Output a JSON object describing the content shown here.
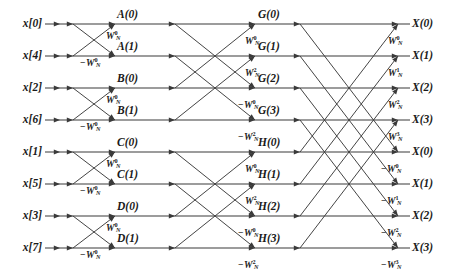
{
  "diagram": {
    "width": 451,
    "height": 278,
    "line_color": "#3a3a3a",
    "text_color": "#1a1a1a",
    "background": "#ffffff"
  },
  "inputs": [
    {
      "label": "x[0]",
      "row": 0
    },
    {
      "label": "x[4]",
      "row": 1
    },
    {
      "label": "x[2]",
      "row": 2
    },
    {
      "label": "x[6]",
      "row": 3
    },
    {
      "label": "x[1]",
      "row": 4
    },
    {
      "label": "x[5]",
      "row": 5
    },
    {
      "label": "x[3]",
      "row": 6
    },
    {
      "label": "x[7]",
      "row": 7
    }
  ],
  "stage1_labels": [
    {
      "label": "A(0)",
      "row": 0
    },
    {
      "label": "A(1)",
      "row": 1
    },
    {
      "label": "B(0)",
      "row": 2
    },
    {
      "label": "B(1)",
      "row": 3
    },
    {
      "label": "C(0)",
      "row": 4
    },
    {
      "label": "C(1)",
      "row": 5
    },
    {
      "label": "D(0)",
      "row": 6
    },
    {
      "label": "D(1)",
      "row": 7
    }
  ],
  "stage2_labels": [
    {
      "label": "G(0)",
      "row": 0
    },
    {
      "label": "G(1)",
      "row": 1
    },
    {
      "label": "G(2)",
      "row": 2
    },
    {
      "label": "G(3)",
      "row": 3
    },
    {
      "label": "H(0)",
      "row": 4
    },
    {
      "label": "H(1)",
      "row": 5
    },
    {
      "label": "H(2)",
      "row": 6
    },
    {
      "label": "H(3)",
      "row": 7
    }
  ],
  "outputs": [
    {
      "label": "X(0)",
      "row": 0
    },
    {
      "label": "X(1)",
      "row": 1
    },
    {
      "label": "X(2)",
      "row": 2
    },
    {
      "label": "X(3)",
      "row": 3
    },
    {
      "label": "X(0)",
      "row": 4
    },
    {
      "label": "X(1)",
      "row": 5
    },
    {
      "label": "X(2)",
      "row": 6
    },
    {
      "label": "X(3)",
      "row": 7
    }
  ],
  "twiddles": {
    "stage1": [
      {
        "sign": "",
        "base": "W",
        "sup": "0",
        "sub": "N",
        "x": 106,
        "y": 32
      },
      {
        "sign": "−",
        "base": "W",
        "sup": "0",
        "sub": "N",
        "x": 80,
        "y": 59
      },
      {
        "sign": "",
        "base": "W",
        "sup": "0",
        "sub": "N",
        "x": 106,
        "y": 96
      },
      {
        "sign": "−",
        "base": "W",
        "sup": "0",
        "sub": "N",
        "x": 80,
        "y": 123
      },
      {
        "sign": "",
        "base": "W",
        "sup": "0",
        "sub": "N",
        "x": 106,
        "y": 160
      },
      {
        "sign": "−",
        "base": "W",
        "sup": "0",
        "sub": "N",
        "x": 80,
        "y": 187
      },
      {
        "sign": "",
        "base": "W",
        "sup": "0",
        "sub": "N",
        "x": 106,
        "y": 224
      },
      {
        "sign": "−",
        "base": "W",
        "sup": "0",
        "sub": "N",
        "x": 80,
        "y": 251
      }
    ],
    "stage2": [
      {
        "sign": "",
        "base": "W",
        "sup": "0",
        "sub": "N",
        "x": 245,
        "y": 37
      },
      {
        "sign": "",
        "base": "W",
        "sup": "2",
        "sub": "N",
        "x": 245,
        "y": 69
      },
      {
        "sign": "−",
        "base": "W",
        "sup": "0",
        "sub": "N",
        "x": 238,
        "y": 101
      },
      {
        "sign": "−",
        "base": "W",
        "sup": "2",
        "sub": "N",
        "x": 238,
        "y": 133
      },
      {
        "sign": "",
        "base": "W",
        "sup": "0",
        "sub": "N",
        "x": 245,
        "y": 165
      },
      {
        "sign": "",
        "base": "W",
        "sup": "2",
        "sub": "N",
        "x": 245,
        "y": 197
      },
      {
        "sign": "−",
        "base": "W",
        "sup": "0",
        "sub": "N",
        "x": 238,
        "y": 229
      },
      {
        "sign": "−",
        "base": "W",
        "sup": "2",
        "sub": "N",
        "x": 238,
        "y": 261
      }
    ],
    "stage3": [
      {
        "sign": "",
        "base": "W",
        "sup": "0",
        "sub": "N",
        "x": 388,
        "y": 37
      },
      {
        "sign": "",
        "base": "W",
        "sup": "1",
        "sub": "N",
        "x": 388,
        "y": 69
      },
      {
        "sign": "",
        "base": "W",
        "sup": "2",
        "sub": "N",
        "x": 388,
        "y": 101
      },
      {
        "sign": "",
        "base": "W",
        "sup": "3",
        "sub": "N",
        "x": 388,
        "y": 133
      },
      {
        "sign": "−",
        "base": "W",
        "sup": "0",
        "sub": "N",
        "x": 381,
        "y": 165
      },
      {
        "sign": "−",
        "base": "W",
        "sup": "1",
        "sub": "N",
        "x": 381,
        "y": 197
      },
      {
        "sign": "−",
        "base": "W",
        "sup": "2",
        "sub": "N",
        "x": 381,
        "y": 229
      },
      {
        "sign": "−",
        "base": "W",
        "sup": "3",
        "sub": "N",
        "x": 381,
        "y": 261
      }
    ]
  },
  "geometry": {
    "row_y": [
      24,
      56,
      88,
      120,
      152,
      184,
      216,
      248
    ],
    "rail_x0": 45,
    "rail_x1": 410,
    "stage1": {
      "x_in": 73,
      "x_out": 115
    },
    "stage2": {
      "x_in": 175,
      "x_out": 255
    },
    "stage3": {
      "x_in": 300,
      "x_out": 398
    }
  }
}
